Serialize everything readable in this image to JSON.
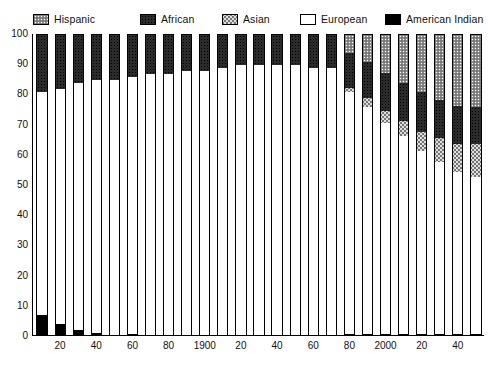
{
  "legend": {
    "items": [
      {
        "label": "Hispanic",
        "key": "hispanic",
        "color": "#8d8d8d"
      },
      {
        "label": "African",
        "key": "african",
        "color": "#2b2b2b"
      },
      {
        "label": "Asian",
        "key": "asian",
        "color": "#dedede"
      },
      {
        "label": "European",
        "key": "european",
        "color": "#ffffff"
      },
      {
        "label": "American Indian",
        "key": "amindian",
        "color": "#000000"
      }
    ]
  },
  "chart_data": {
    "type": "bar",
    "subtype": "stacked-100-percent",
    "title": "",
    "xlabel": "",
    "ylabel": "",
    "ylim": [
      0,
      100
    ],
    "ytick_step": 10,
    "grid": false,
    "legend_position": "top",
    "stack_order_top_to_bottom": [
      "Hispanic",
      "African",
      "Asian",
      "European",
      "American Indian"
    ],
    "categories": [
      1810,
      1820,
      1830,
      1840,
      1850,
      1860,
      1870,
      1880,
      1890,
      1900,
      1910,
      1920,
      1930,
      1940,
      1950,
      1960,
      1970,
      1980,
      1990,
      2000,
      2010,
      2020,
      2030,
      2040,
      2050
    ],
    "xtick_labels": [
      "",
      "20",
      "",
      "40",
      "",
      "60",
      "",
      "80",
      "",
      "1900",
      "",
      "20",
      "",
      "40",
      "",
      "60",
      "",
      "80",
      "",
      "2000",
      "",
      "20",
      "",
      "40",
      ""
    ],
    "ytick_labels": [
      "0",
      "10",
      "20",
      "30",
      "40",
      "50",
      "60",
      "70",
      "80",
      "90",
      "100"
    ],
    "series": [
      {
        "name": "Hispanic",
        "values": [
          0,
          0,
          0,
          0,
          0,
          0,
          0,
          0,
          0,
          0,
          0,
          0,
          0,
          0,
          0,
          0,
          0,
          6,
          9,
          12.5,
          16,
          19,
          21.5,
          23.5,
          24
        ]
      },
      {
        "name": "African",
        "values": [
          19,
          18,
          16,
          15,
          15,
          14,
          13,
          13,
          12,
          12,
          11,
          10,
          10,
          10,
          10,
          11,
          11,
          11.5,
          12,
          12.5,
          12.5,
          13,
          12.5,
          12.5,
          12
        ]
      },
      {
        "name": "Asian",
        "values": [
          0,
          0,
          0,
          0,
          0,
          0,
          0,
          0,
          0,
          0,
          0,
          0,
          0,
          0,
          0,
          0,
          0,
          1.5,
          3,
          4,
          5,
          6.5,
          8,
          9.5,
          11
        ]
      },
      {
        "name": "European",
        "values": [
          74,
          78,
          82,
          84,
          85,
          85.5,
          86.7,
          86.8,
          87.8,
          87.8,
          88.8,
          89.8,
          89.8,
          89.8,
          89.8,
          88.8,
          88.7,
          80.5,
          75.5,
          70.5,
          65.9,
          60.8,
          57.3,
          53.8,
          52.3
        ]
      },
      {
        "name": "American Indian",
        "values": [
          7,
          4,
          2,
          1,
          0.5,
          0.5,
          0.3,
          0.2,
          0.2,
          0.2,
          0.2,
          0.2,
          0.2,
          0.2,
          0.2,
          0.2,
          0.3,
          0.5,
          0.5,
          0.5,
          0.6,
          0.7,
          0.7,
          0.7,
          0.7
        ]
      }
    ]
  }
}
